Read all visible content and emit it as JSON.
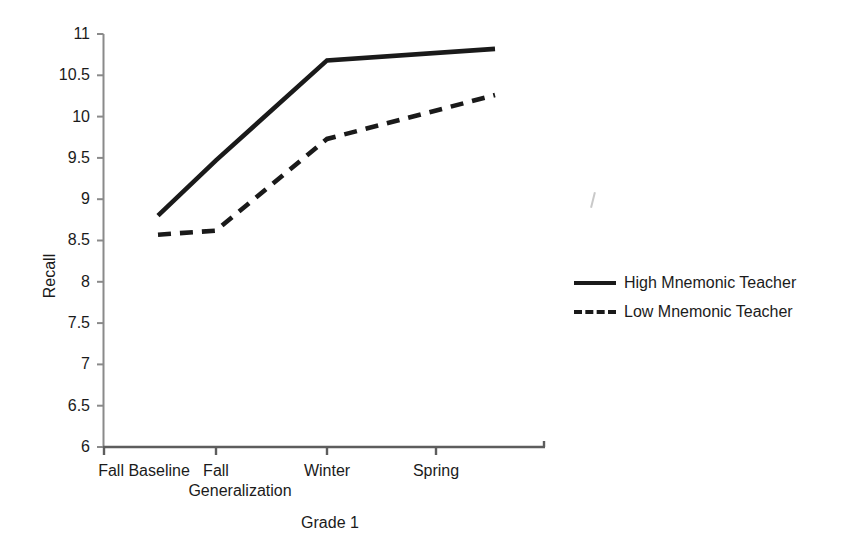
{
  "chart_data": {
    "type": "line",
    "title": "",
    "xlabel": "Grade 1",
    "ylabel": "Recall",
    "categories": [
      "Fall Baseline",
      "Fall Generalization",
      "Winter",
      "Spring"
    ],
    "category_lines": [
      [
        "Fall Baseline"
      ],
      [
        "Fall",
        "Generalization"
      ],
      [
        "Winter"
      ],
      [
        "Spring"
      ]
    ],
    "series": [
      {
        "name": "High Mnemonic Teacher",
        "style": "solid",
        "color": "#1a1a1a",
        "values": [
          8.8,
          9.47,
          10.68,
          10.82
        ]
      },
      {
        "name": "Low Mnemonic Teacher",
        "style": "dashed",
        "color": "#1a1a1a",
        "values": [
          8.57,
          8.62,
          9.73,
          10.26
        ]
      }
    ],
    "ylim": [
      6,
      11
    ],
    "ytick_values": [
      6,
      6.5,
      7,
      7.5,
      8,
      8.5,
      9,
      9.5,
      10,
      10.5,
      11
    ],
    "ytick_labels": [
      "6",
      "6.5",
      "7",
      "7.5",
      "8",
      "8.5",
      "9",
      "9.5",
      "10",
      "10.5",
      "11"
    ],
    "grid": false,
    "legend_position": "right",
    "legend_entries": [
      "High Mnemonic Teacher",
      "Low Mnemonic Teacher"
    ]
  },
  "axes": {
    "y_title": "Recall",
    "x_title": "Grade 1"
  },
  "legend": {
    "rows": [
      {
        "label": "High Mnemonic Teacher",
        "style": "solid"
      },
      {
        "label": "Low Mnemonic Teacher",
        "style": "dashed"
      }
    ]
  }
}
